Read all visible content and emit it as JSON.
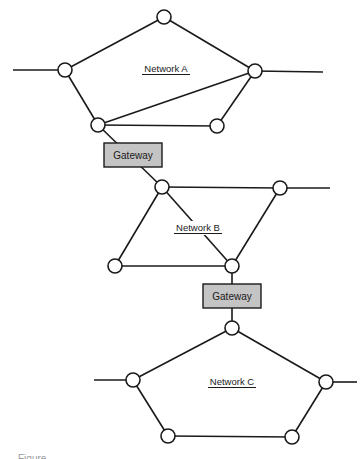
{
  "diagram": {
    "type": "network-topology",
    "colors": {
      "line": "#1a1a1a",
      "node_fill": "#ffffff",
      "gateway_fill": "#c4c4c4",
      "background": "#ffffff"
    },
    "networks": [
      {
        "id": "A",
        "label": "Network A",
        "label_pos": [
          166,
          72
        ],
        "nodes": [
          {
            "id": "A1",
            "x": 164,
            "y": 17
          },
          {
            "id": "A2",
            "x": 65,
            "y": 70
          },
          {
            "id": "A3",
            "x": 255,
            "y": 71
          },
          {
            "id": "A4",
            "x": 98,
            "y": 125
          },
          {
            "id": "A5",
            "x": 217,
            "y": 126
          }
        ],
        "links": [
          [
            "A1",
            "A2"
          ],
          [
            "A1",
            "A3"
          ],
          [
            "A2",
            "A4"
          ],
          [
            "A4",
            "A3"
          ],
          [
            "A4",
            "A5"
          ],
          [
            "A5",
            "A3"
          ]
        ],
        "external_links": [
          {
            "from": "A2",
            "to": [
              13,
              70
            ]
          },
          {
            "from": "A3",
            "to": [
              323,
              72
            ]
          }
        ]
      },
      {
        "id": "B",
        "label": "Network B",
        "label_pos": [
          198,
          231
        ],
        "nodes": [
          {
            "id": "B1",
            "x": 162,
            "y": 187
          },
          {
            "id": "B2",
            "x": 280,
            "y": 188
          },
          {
            "id": "B3",
            "x": 115,
            "y": 266
          },
          {
            "id": "B4",
            "x": 232,
            "y": 266
          }
        ],
        "links": [
          [
            "B1",
            "B2"
          ],
          [
            "B1",
            "B3"
          ],
          [
            "B1",
            "B4"
          ],
          [
            "B2",
            "B4"
          ],
          [
            "B3",
            "B4"
          ]
        ],
        "external_links": [
          {
            "from": "B2",
            "to": [
              330,
              188
            ]
          }
        ]
      },
      {
        "id": "C",
        "label": "Network C",
        "label_pos": [
          232,
          385
        ],
        "nodes": [
          {
            "id": "C1",
            "x": 232,
            "y": 328
          },
          {
            "id": "C2",
            "x": 133,
            "y": 380
          },
          {
            "id": "C3",
            "x": 326,
            "y": 382
          },
          {
            "id": "C4",
            "x": 168,
            "y": 436
          },
          {
            "id": "C5",
            "x": 292,
            "y": 437
          }
        ],
        "links": [
          [
            "C1",
            "C2"
          ],
          [
            "C1",
            "C3"
          ],
          [
            "C2",
            "C4"
          ],
          [
            "C4",
            "C5"
          ],
          [
            "C5",
            "C3"
          ]
        ],
        "external_links": [
          {
            "from": "C2",
            "to": [
              94,
              380
            ]
          },
          {
            "from": "C3",
            "to": [
              357,
              382
            ]
          }
        ]
      }
    ],
    "gateways": [
      {
        "id": "G1",
        "label": "Gateway",
        "x": 104,
        "y": 143,
        "width": 58,
        "height": 24,
        "connects": [
          "A4",
          "B1"
        ]
      },
      {
        "id": "G2",
        "label": "Gateway",
        "x": 203,
        "y": 284,
        "width": 58,
        "height": 24,
        "connects": [
          "B4",
          "C1"
        ]
      }
    ]
  },
  "caption": {
    "text": "Figure"
  }
}
